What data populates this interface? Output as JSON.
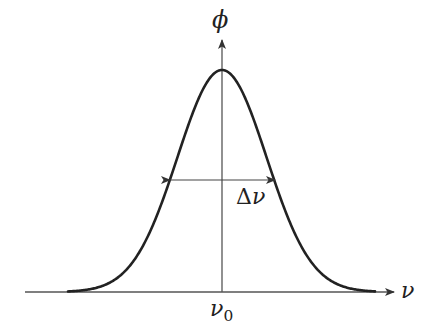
{
  "diagram": {
    "y_axis_label": "ϕ",
    "x_axis_label": "ν",
    "center_label": {
      "symbol": "ν",
      "subscript": "0"
    },
    "width_label": {
      "delta": "Δ",
      "symbol": "ν"
    },
    "colors": {
      "curve": "#222222",
      "axis": "#555555",
      "text": "#222222"
    },
    "curve": {
      "type": "gaussian",
      "center_px": 222,
      "peak_y_px": 70,
      "baseline_y_px": 292,
      "sigma_px": 44.6,
      "x_start_px": 68,
      "x_end_px": 375
    },
    "fwhm_arrow": {
      "y_px": 180,
      "x_left_px": 170,
      "x_right_px": 275
    }
  }
}
